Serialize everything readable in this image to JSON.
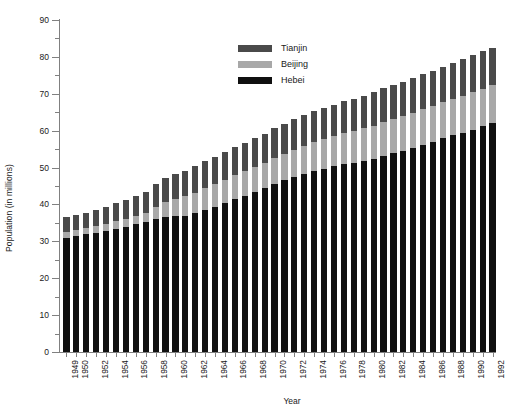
{
  "chart_data": {
    "type": "bar",
    "stacked": true,
    "title": "",
    "xlabel": "Year",
    "ylabel": "Population (in millions)",
    "ylim": [
      0,
      90
    ],
    "ytick_step": 10,
    "yminor_step": 5,
    "grid": false,
    "legend_position": "upper-center",
    "ytick_labels": [
      "0",
      "10",
      "20",
      "30",
      "40",
      "50",
      "60",
      "70",
      "80",
      "90"
    ],
    "categories": [
      "1949",
      "1950",
      "1951",
      "1952",
      "1953",
      "1954",
      "1955",
      "1956",
      "1957",
      "1958",
      "1959",
      "1960",
      "1961",
      "1962",
      "1963",
      "1964",
      "1965",
      "1966",
      "1967",
      "1968",
      "1969",
      "1970",
      "1971",
      "1972",
      "1973",
      "1974",
      "1975",
      "1976",
      "1977",
      "1978",
      "1979",
      "1980",
      "1981",
      "1982",
      "1983",
      "1984",
      "1985",
      "1986",
      "1987",
      "1988",
      "1989",
      "1990",
      "1991",
      "1992"
    ],
    "xtick_labels_shown": [
      "1949",
      "1950",
      "1952",
      "1954",
      "1956",
      "1958",
      "1960",
      "1962",
      "1964",
      "1966",
      "1968",
      "1970",
      "1972",
      "1974",
      "1976",
      "1978",
      "1980",
      "1982",
      "1984",
      "1986",
      "1988",
      "1990",
      "1992"
    ],
    "series": [
      {
        "name": "Hebei",
        "color": "#101010",
        "values": [
          31.0,
          31.4,
          31.9,
          32.3,
          32.8,
          33.4,
          34.0,
          34.6,
          35.2,
          36.0,
          36.5,
          36.8,
          37.0,
          37.6,
          38.5,
          39.4,
          40.4,
          41.4,
          42.4,
          43.4,
          44.4,
          45.5,
          46.5,
          47.4,
          48.2,
          49.0,
          49.7,
          50.3,
          50.9,
          51.3,
          51.8,
          52.4,
          53.2,
          53.9,
          54.6,
          55.3,
          56.2,
          57.0,
          57.9,
          58.7,
          59.5,
          60.3,
          61.2,
          62.0
        ]
      },
      {
        "name": "Beijing",
        "color": "#a8a8a8",
        "values": [
          1.5,
          1.6,
          1.7,
          1.8,
          1.9,
          2.0,
          2.1,
          2.3,
          2.5,
          3.4,
          4.1,
          4.6,
          5.2,
          5.6,
          5.9,
          6.1,
          6.3,
          6.5,
          6.7,
          6.8,
          6.9,
          7.1,
          7.3,
          7.5,
          7.7,
          7.9,
          8.0,
          8.2,
          8.4,
          8.6,
          8.8,
          9.0,
          9.2,
          9.3,
          9.4,
          9.5,
          9.6,
          9.7,
          9.8,
          9.9,
          10.0,
          10.1,
          10.2,
          10.3
        ]
      },
      {
        "name": "Tianjin",
        "color": "#4a4a4a",
        "values": [
          4.0,
          4.1,
          4.2,
          4.3,
          4.6,
          4.9,
          5.1,
          5.5,
          5.8,
          6.2,
          6.5,
          6.8,
          7.0,
          7.2,
          7.3,
          7.4,
          7.5,
          7.6,
          7.7,
          7.8,
          7.9,
          8.0,
          8.1,
          8.2,
          8.3,
          8.4,
          8.5,
          8.6,
          8.7,
          8.8,
          8.9,
          9.0,
          9.1,
          9.2,
          9.3,
          9.4,
          9.5,
          9.6,
          9.7,
          9.8,
          9.9,
          10.0,
          10.1,
          10.2
        ]
      }
    ],
    "totals": [
      36.5,
      37.1,
      37.8,
      38.4,
      39.3,
      40.3,
      41.2,
      42.4,
      43.5,
      45.6,
      47.1,
      48.2,
      49.2,
      50.4,
      51.7,
      52.9,
      54.2,
      55.5,
      56.8,
      58.0,
      59.2,
      60.6,
      61.9,
      63.1,
      64.2,
      65.3,
      66.2,
      67.1,
      68.0,
      68.7,
      69.5,
      70.4,
      71.5,
      72.4,
      73.3,
      74.2,
      75.3,
      76.3,
      77.4,
      78.4,
      79.4,
      80.4,
      81.5,
      82.5
    ],
    "legend": [
      {
        "label": "Tianjin",
        "color": "#4a4a4a"
      },
      {
        "label": "Beijing",
        "color": "#a8a8a8"
      },
      {
        "label": "Hebei",
        "color": "#101010"
      }
    ]
  }
}
